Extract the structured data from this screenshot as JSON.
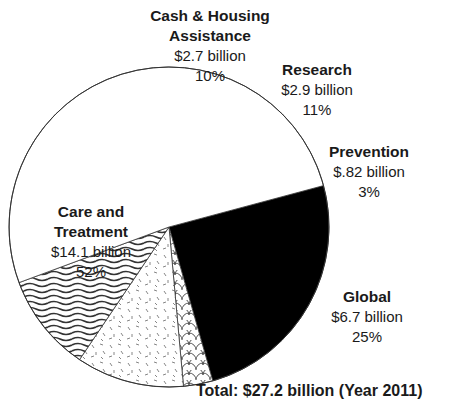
{
  "chart_data": {
    "type": "pie",
    "title": "",
    "total_label": "Total: $27.2 billion (Year 2011)",
    "slices": [
      {
        "name": "Global",
        "amount": "$6.7 billion",
        "value": 6.7,
        "percent": 25,
        "percent_label": "25%",
        "fill": "#000000",
        "pattern": "solid"
      },
      {
        "name": "Prevention",
        "amount": "$.82 billion",
        "value": 0.82,
        "percent": 3,
        "percent_label": "3%",
        "fill": "#ffffff",
        "pattern": "scallops"
      },
      {
        "name": "Research",
        "amount": "$2.9 billion",
        "value": 2.9,
        "percent": 11,
        "percent_label": "11%",
        "fill": "#ffffff",
        "pattern": "speckles"
      },
      {
        "name": "Cash & Housing Assistance",
        "amount": "$2.7 billion",
        "value": 2.7,
        "percent": 10,
        "percent_label": "10%",
        "fill": "#ffffff",
        "pattern": "wavy-lines"
      },
      {
        "name": "Care and Treatment",
        "amount": "$14.1 billion",
        "value": 14.1,
        "percent": 52,
        "percent_label": "52%",
        "fill": "#ffffff",
        "pattern": "none"
      }
    ]
  },
  "labels": {
    "cash": {
      "name": "Cash & Housing Assistance",
      "amount": "$2.7 billion",
      "pct": "10%"
    },
    "research": {
      "name": "Research",
      "amount": "$2.9 billion",
      "pct": "11%"
    },
    "prevention": {
      "name": "Prevention",
      "amount": "$.82 billion",
      "pct": "3%"
    },
    "care_line1": "Care and",
    "care_line2": "Treatment",
    "care": {
      "amount": "$14.1 billion",
      "pct": "52%"
    },
    "global": {
      "name": "Global",
      "amount": "$6.7 billion",
      "pct": "25%"
    },
    "total": "Total: $27.2 billion (Year 2011)"
  }
}
